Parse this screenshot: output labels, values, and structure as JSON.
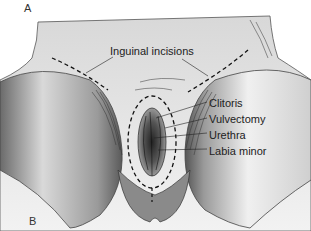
{
  "figure": {
    "panel_top": "A",
    "panel_bottom": "B",
    "labels": {
      "inguinal": "Inguinal incisions",
      "clitoris": "Clitoris",
      "vulvectomy": "Vulvectomy",
      "urethra": "Urethra",
      "labia": "Labia minor"
    }
  }
}
